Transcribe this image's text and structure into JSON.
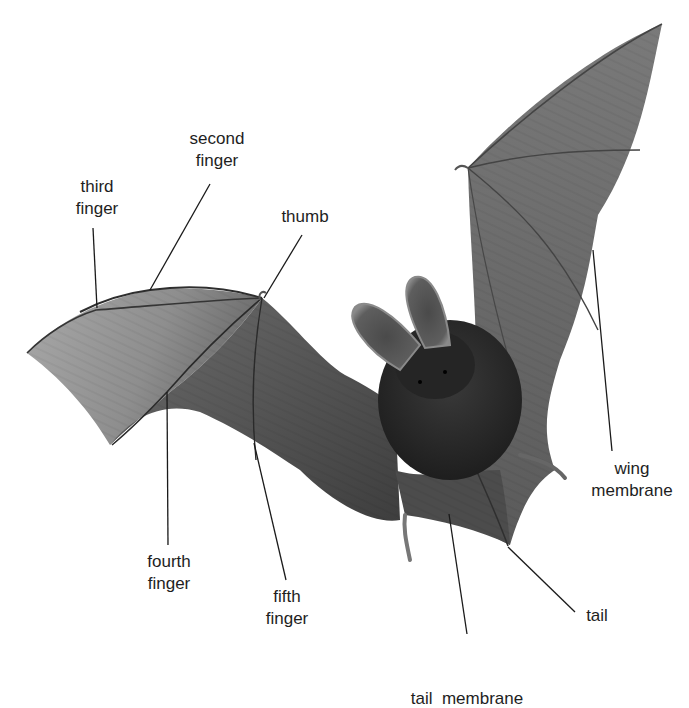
{
  "diagram": {
    "colors": {
      "background": "#ffffff",
      "label_text": "#1e1e1e",
      "leader_line": "#1a1a1a",
      "membrane_light": "#9a9a9a",
      "membrane_mid": "#6e6e6e",
      "membrane_dark": "#3c3c3c",
      "body_fur": "#2a2a2a"
    },
    "labels": [
      {
        "id": "second-finger",
        "lines": [
          "second",
          "finger"
        ],
        "x": 217,
        "y": 128,
        "leader": {
          "x1": 210,
          "y1": 184,
          "x2": 150,
          "y2": 290
        }
      },
      {
        "id": "third-finger",
        "lines": [
          "third",
          "finger"
        ],
        "x": 97,
        "y": 176,
        "leader": {
          "x1": 93,
          "y1": 228,
          "x2": 97,
          "y2": 308
        }
      },
      {
        "id": "thumb",
        "lines": [
          "thumb"
        ],
        "x": 305,
        "y": 206,
        "leader": {
          "x1": 302,
          "y1": 235,
          "x2": 264,
          "y2": 298
        }
      },
      {
        "id": "wing-membrane",
        "lines": [
          "wing",
          "membrane"
        ],
        "x": 632,
        "y": 458,
        "leader": {
          "x1": 612,
          "y1": 451,
          "x2": 593,
          "y2": 250
        }
      },
      {
        "id": "fourth-finger",
        "lines": [
          "fourth",
          "finger"
        ],
        "x": 169,
        "y": 551,
        "leader": {
          "x1": 168,
          "y1": 545,
          "x2": 167,
          "y2": 392
        }
      },
      {
        "id": "fifth-finger",
        "lines": [
          "fifth",
          "finger"
        ],
        "x": 287,
        "y": 586,
        "leader": {
          "x1": 286,
          "y1": 580,
          "x2": 254,
          "y2": 443
        }
      },
      {
        "id": "tail",
        "lines": [
          "tail"
        ],
        "x": 597,
        "y": 605,
        "leader": {
          "x1": 575,
          "y1": 612,
          "x2": 508,
          "y2": 547
        }
      },
      {
        "id": "tail-membrane",
        "lines": [
          "tail  membrane"
        ],
        "x": 467,
        "y": 644,
        "leader": {
          "x1": 467,
          "y1": 634,
          "x2": 449,
          "y2": 514
        }
      }
    ]
  }
}
